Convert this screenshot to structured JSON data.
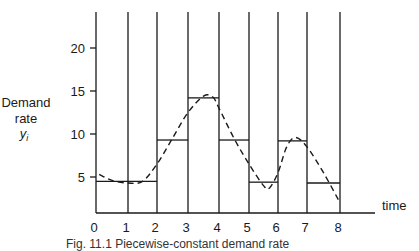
{
  "chart_data": {
    "type": "line",
    "title": "",
    "xlabel": "time",
    "ylabel": [
      "Demand",
      "rate",
      "y_i"
    ],
    "x_ticks": [
      0,
      1,
      2,
      3,
      4,
      5,
      6,
      7,
      8
    ],
    "y_ticks": [
      5,
      10,
      15,
      20
    ],
    "xlim": [
      0,
      8
    ],
    "ylim": [
      0,
      23
    ],
    "grid": "vertical lines at each integer time",
    "series": [
      {
        "name": "piecewise-constant demand rate",
        "style": "solid-step",
        "segments": [
          {
            "t_start": 0,
            "t_end": 2,
            "value": 4.5
          },
          {
            "t_start": 2,
            "t_end": 3,
            "value": 9.3
          },
          {
            "t_start": 3,
            "t_end": 4,
            "value": 14.2
          },
          {
            "t_start": 4,
            "t_end": 5,
            "value": 9.3
          },
          {
            "t_start": 5,
            "t_end": 6,
            "value": 4.4
          },
          {
            "t_start": 6,
            "t_end": 7,
            "value": 9.2
          },
          {
            "t_start": 7,
            "t_end": 8,
            "value": 4.3
          }
        ]
      },
      {
        "name": "continuous demand curve",
        "style": "dashed",
        "x": [
          0.1,
          0.5,
          1.0,
          1.5,
          2.0,
          2.5,
          3.0,
          3.5,
          3.8,
          4.0,
          4.5,
          5.0,
          5.5,
          5.7,
          6.0,
          6.3,
          6.6,
          7.0,
          7.5,
          8.0
        ],
        "values": [
          5.3,
          4.6,
          4.3,
          4.5,
          6.5,
          9.5,
          12.5,
          14.4,
          14.3,
          13.0,
          9.5,
          6.5,
          4.0,
          3.7,
          5.5,
          8.5,
          9.6,
          8.5,
          5.5,
          2.0
        ]
      }
    ]
  },
  "axis": {
    "y_label_line1": "Demand",
    "y_label_line2": "rate",
    "y_label_line3": "y",
    "y_label_sub": "i",
    "x_label": "time",
    "x_tick_labels": [
      "0",
      "1",
      "2",
      "3",
      "4",
      "5",
      "6",
      "7",
      "8"
    ],
    "y_tick_labels": [
      "5",
      "10",
      "15",
      "20"
    ]
  },
  "caption": "Fig. 11.1  Piecewise-constant demand rate"
}
